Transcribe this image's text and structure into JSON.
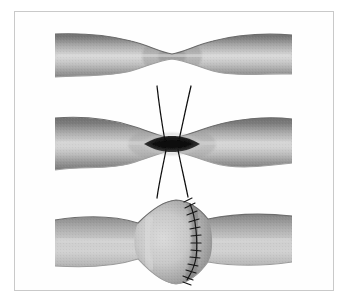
{
  "figure": {
    "title": "Patch angioplasty of a stenotic vessel",
    "type": "medical-illustration",
    "style": "grayscale-airbrush",
    "panel_count": 3,
    "background_color": "#ffffff",
    "frame_color": "#c9c9c9"
  },
  "palette": {
    "vessel_edge_dark": "#6f6f6f",
    "vessel_edge_mid": "#8e8e8e",
    "vessel_lumen_light": "#cfcfcf",
    "vessel_highlight": "#dcdcdc",
    "vessel_outline": "#7a7a7a",
    "incision_dark": "#1d1d1d",
    "incision_rim": "#b9b9b9",
    "suture_thread": "#111111",
    "patch_shadow": "#7d7d7d"
  },
  "panels": [
    {
      "index": 1,
      "name": "stenotic-vessel",
      "label": "Stenotic vessel with narrowed lumen",
      "description": "Tubular vessel running horizontally with a symmetric waist-like constriction at mid-length",
      "stenosis": {
        "center_x": 172,
        "waist_height_px": 11,
        "normal_height_px": 42
      },
      "vessel_span": {
        "x_start": 55,
        "x_end": 292,
        "y_top": 33,
        "y_bottom": 76
      },
      "features": []
    },
    {
      "index": 2,
      "name": "arteriotomy-with-stay-sutures",
      "label": "Longitudinal arteriotomy opened with stay sutures",
      "description": "Same vessel incised lengthwise at the stenosis; the lens-shaped opening is held apart by four stay suture threads radiating above and below",
      "incision": {
        "center_x": 172,
        "center_y": 144,
        "length_px": 66,
        "width_px": 17,
        "shape": "lens"
      },
      "stay_sutures": [
        {
          "name": "stay-suture-upper-left",
          "from_x": 165,
          "from_y": 140,
          "to_x": 157,
          "to_y": 86
        },
        {
          "name": "stay-suture-upper-right",
          "from_x": 179,
          "from_y": 139,
          "to_x": 191,
          "to_y": 86
        },
        {
          "name": "stay-suture-lower-left",
          "from_x": 166,
          "from_y": 150,
          "to_x": 157,
          "to_y": 198
        },
        {
          "name": "stay-suture-lower-right",
          "from_x": 178,
          "from_y": 150,
          "to_x": 188,
          "to_y": 197
        }
      ],
      "vessel_span": {
        "x_start": 55,
        "x_end": 292,
        "y_top": 116,
        "y_bottom": 172
      }
    },
    {
      "index": 3,
      "name": "completed-patch-angioplasty",
      "label": "Completed patch angioplasty with running suture line",
      "description": "The arteriotomy has been closed with an oval patch, widening the vessel into a fusiform bulge; a continuous running suture marks the patch margin",
      "patch": {
        "bulge_center_x": 176,
        "bulge_top_y": 200,
        "bulge_bottom_y": 284,
        "max_height_px": 84
      },
      "suture_line": {
        "name": "running-suture-line",
        "stitch_count": 13,
        "path": "curves convex to the right from the superior apex to the inferior apex of the patch",
        "top_x": 190,
        "top_y": 205,
        "mid_x": 198,
        "mid_y": 242,
        "bottom_x": 187,
        "bottom_y": 279
      },
      "vessel_span": {
        "x_start": 55,
        "x_end": 292,
        "y_top": 213,
        "y_bottom": 268
      }
    }
  ],
  "annotations": {
    "visible_text": [],
    "note": "No text labels, numbers, captions or legends are rendered in this image."
  }
}
